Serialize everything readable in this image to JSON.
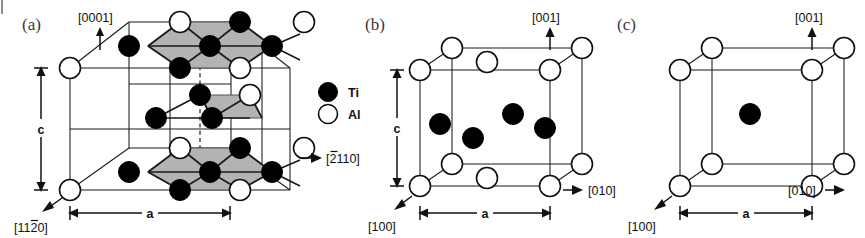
{
  "figure": {
    "width": 865,
    "height": 238,
    "background": "#ffffff"
  },
  "colors": {
    "ti_atom": "#000000",
    "al_atom": "#ffffff",
    "atom_outline": "#111111",
    "cell_edge": "#1a1a1a",
    "shaded_face": "#b3b3b3",
    "text": "#111111",
    "panel_tag": "#3a3a3a"
  },
  "legend": {
    "name": "atom-legend",
    "entries": [
      {
        "symbol": "filled-circle",
        "label": "Ti",
        "color": "#000000"
      },
      {
        "symbol": "open-circle",
        "label": "Al",
        "color": "#ffffff"
      }
    ]
  },
  "panels": [
    {
      "id": "a",
      "tag": "(a)",
      "lattice": "hexagonal",
      "directions": [
        {
          "label": "[0001]",
          "overbar": "",
          "arrow": "up"
        },
        {
          "label": "[2110]",
          "overbar_on": "2",
          "arrow": "right"
        },
        {
          "label": "[1120]",
          "overbar_on": "2",
          "arrow": "down-left"
        }
      ],
      "dimensions": [
        {
          "label": "c",
          "orientation": "vertical"
        },
        {
          "label": "a",
          "orientation": "horizontal"
        }
      ],
      "atom_counts": {
        "ti": 20,
        "al": 10
      },
      "shaded_faces": 3
    },
    {
      "id": "b",
      "tag": "(b)",
      "lattice": "tetragonal",
      "directions": [
        {
          "label": "[001]",
          "overbar": "",
          "arrow": "up"
        },
        {
          "label": "[010]",
          "overbar": "",
          "arrow": "right"
        },
        {
          "label": "[100]",
          "overbar": "",
          "arrow": "down-left"
        }
      ],
      "dimensions": [
        {
          "label": "c",
          "orientation": "vertical"
        },
        {
          "label": "a",
          "orientation": "horizontal"
        }
      ],
      "atom_counts": {
        "ti": 4,
        "al": 10
      },
      "shaded_faces": 0
    },
    {
      "id": "c",
      "tag": "(c)",
      "lattice": "cubic",
      "directions": [
        {
          "label": "[001]",
          "overbar": "",
          "arrow": "up"
        },
        {
          "label": "[010]",
          "overbar": "",
          "arrow": "right"
        },
        {
          "label": "[100]",
          "overbar": "",
          "arrow": "down-left"
        }
      ],
      "dimensions": [
        {
          "label": "a",
          "orientation": "horizontal"
        }
      ],
      "atom_counts": {
        "ti": 1,
        "al": 8
      },
      "shaded_faces": 0
    }
  ],
  "labels": {
    "panel_a_tag": "(a)",
    "panel_b_tag": "(b)",
    "panel_c_tag": "(c)",
    "dir_0001": "[0001]",
    "dir_2110_pre": "[",
    "dir_2110_bar": "2",
    "dir_2110_post": "110]",
    "dir_1120_pre": "[11",
    "dir_1120_bar": "2",
    "dir_1120_post": "0]",
    "dir_001_b": "[001]",
    "dir_010_b": "[010]",
    "dir_100_b": "[100]",
    "dir_001_c": "[001]",
    "dir_010_c": "[010]",
    "dir_100_c": "[100]",
    "dim_c_a": "c",
    "dim_a_a": "a",
    "dim_c_b": "c",
    "dim_a_b": "a",
    "dim_a_c": "a",
    "legend_ti": "Ti",
    "legend_al": "Al"
  }
}
